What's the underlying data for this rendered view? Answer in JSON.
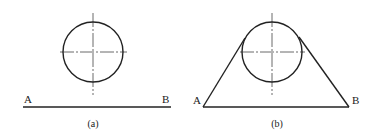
{
  "colors": {
    "stroke": "#222222",
    "centerline": "#444444",
    "background": "#ffffff"
  },
  "figures": [
    {
      "id": "a",
      "caption": "(a)",
      "point_labels": {
        "left": "A",
        "right": "B"
      },
      "circle": {
        "cx": 93,
        "cy": 52,
        "r": 30
      },
      "centerlines": {
        "vertical": {
          "x": 93,
          "y1": 13,
          "y2": 95
        },
        "horizontal": {
          "y": 52,
          "x1": 60,
          "x2": 127
        }
      },
      "line_ab": {
        "x1": 23,
        "y1": 107,
        "x2": 171,
        "y2": 107
      }
    },
    {
      "id": "b",
      "caption": "(b)",
      "point_labels": {
        "left": "A",
        "right": "B"
      },
      "circle": {
        "cx": 272,
        "cy": 52,
        "r": 30
      },
      "centerlines": {
        "vertical": {
          "x": 272,
          "y1": 13,
          "y2": 95
        },
        "horizontal": {
          "y": 52,
          "x1": 240,
          "x2": 305
        }
      },
      "line_ab": {
        "x1": 203,
        "y1": 107,
        "x2": 349,
        "y2": 107
      },
      "tangent_left": {
        "x1": 203,
        "y1": 107,
        "x2": 245,
        "y2": 38
      },
      "tangent_right": {
        "x1": 299,
        "y1": 37,
        "x2": 349,
        "y2": 107
      }
    }
  ]
}
